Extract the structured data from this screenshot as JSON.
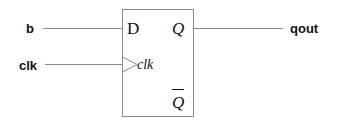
{
  "diagram": {
    "type": "D flip-flop",
    "inputs": [
      {
        "label": "b",
        "pin": "D"
      },
      {
        "label": "clk",
        "pin": "clk"
      }
    ],
    "outputs": [
      {
        "label": "qout",
        "pin": "Q"
      }
    ],
    "pins": {
      "d": "D",
      "q": "Q",
      "clk": "clk",
      "qbar": "Q"
    },
    "colors": {
      "line": "#8a8a8a",
      "text": "#111111",
      "background": "#ffffff"
    }
  }
}
